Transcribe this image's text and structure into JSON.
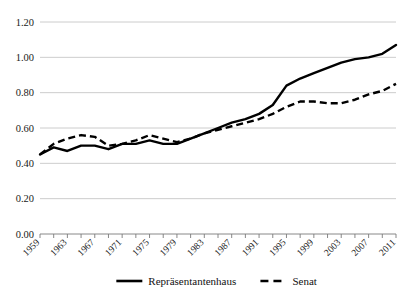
{
  "chart_data": {
    "type": "line",
    "title": "",
    "subtitle": "",
    "xlabel": "",
    "ylabel": "",
    "ylim": [
      0.0,
      1.2
    ],
    "ytick_labels": [
      "0.00",
      "0.20",
      "0.40",
      "0.60",
      "0.80",
      "1.00",
      "1.20"
    ],
    "ytick_values": [
      0.0,
      0.2,
      0.4,
      0.6,
      0.8,
      1.0,
      1.2
    ],
    "grid": "horizontal",
    "legend_position": "bottom-center",
    "x": [
      1959,
      1961,
      1963,
      1965,
      1967,
      1969,
      1971,
      1973,
      1975,
      1977,
      1979,
      1981,
      1983,
      1985,
      1987,
      1989,
      1991,
      1993,
      1995,
      1997,
      1999,
      2001,
      2003,
      2005,
      2007,
      2009,
      2011
    ],
    "xtick_labels": [
      "1959",
      "1963",
      "1967",
      "1971",
      "1975",
      "1979",
      "1983",
      "1987",
      "1991",
      "1995",
      "1999",
      "2003",
      "2007",
      "2011"
    ],
    "xtick_label_values": [
      1959,
      1963,
      1967,
      1971,
      1975,
      1979,
      1983,
      1987,
      1991,
      1995,
      1999,
      2003,
      2007,
      2011
    ],
    "xlim": [
      1959,
      2011
    ],
    "series": [
      {
        "name": "Repräsentantenhaus",
        "style": "solid",
        "color": "#000000",
        "values": [
          0.45,
          0.49,
          0.47,
          0.5,
          0.5,
          0.48,
          0.51,
          0.51,
          0.53,
          0.51,
          0.51,
          0.54,
          0.57,
          0.6,
          0.63,
          0.65,
          0.68,
          0.73,
          0.84,
          0.88,
          0.91,
          0.94,
          0.97,
          0.99,
          1.0,
          1.02,
          1.07
        ]
      },
      {
        "name": "Senat",
        "style": "dashed",
        "color": "#000000",
        "values": [
          0.45,
          0.51,
          0.54,
          0.56,
          0.55,
          0.5,
          0.51,
          0.53,
          0.56,
          0.54,
          0.52,
          0.54,
          0.57,
          0.59,
          0.61,
          0.63,
          0.65,
          0.68,
          0.72,
          0.75,
          0.75,
          0.74,
          0.74,
          0.76,
          0.79,
          0.81,
          0.85
        ]
      }
    ]
  },
  "legend": {
    "items": [
      {
        "label": "Repräsentantenhaus",
        "style": "solid"
      },
      {
        "label": "Senat",
        "style": "dashed"
      }
    ]
  }
}
